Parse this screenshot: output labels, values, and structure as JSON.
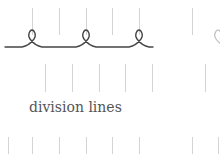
{
  "label": "division lines",
  "colors": {
    "division_line": "#d4d4d4",
    "curve": "#444444",
    "text": "#555555"
  },
  "rows": {
    "top": {
      "y1": 8,
      "y2": 35,
      "x": [
        32,
        59,
        86,
        112,
        139,
        192
      ]
    },
    "middle": {
      "y1": 64,
      "y2": 92,
      "x": [
        45,
        72,
        99,
        125,
        152,
        205
      ]
    },
    "bottom": {
      "y1": 137,
      "y2": 154,
      "x": [
        8,
        32,
        59,
        86,
        112,
        139,
        192,
        218
      ]
    }
  },
  "curve": {
    "baseline_y": 47,
    "loops_x": [
      32,
      86,
      139,
      218
    ],
    "start_x": 5,
    "end_x": 153
  }
}
